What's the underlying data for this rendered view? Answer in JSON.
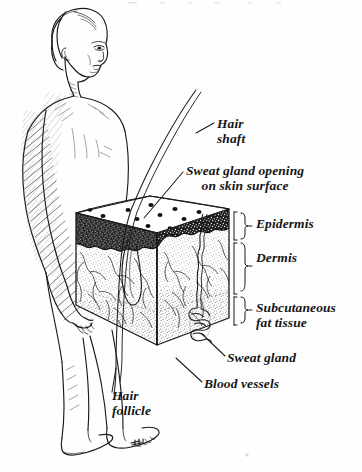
{
  "diagram": {
    "type": "anatomical-line-drawing",
    "style": "black-and-white pen-and-ink engraving",
    "background_color": "#fefefe",
    "ink_color": "#151515",
    "labels": [
      {
        "id": "hair-shaft",
        "text": "Hair\nshaft",
        "lines": [
          "Hair",
          "shaft"
        ]
      },
      {
        "id": "sweat-opening",
        "text": "Sweat gland opening\non skin surface",
        "lines": [
          "Sweat gland opening",
          "on skin surface"
        ]
      },
      {
        "id": "epidermis",
        "text": "Epidermis",
        "lines": [
          "Epidermis"
        ]
      },
      {
        "id": "dermis",
        "text": "Dermis",
        "lines": [
          "Dermis"
        ]
      },
      {
        "id": "subcutaneous",
        "text": "Subcutaneous\nfat tissue",
        "lines": [
          "Subcutaneous",
          "fat tissue"
        ]
      },
      {
        "id": "sweat-gland",
        "text": "Sweat gland",
        "lines": [
          "Sweat gland"
        ]
      },
      {
        "id": "blood-vessels",
        "text": "Blood vessels",
        "lines": [
          "Blood vessels"
        ]
      },
      {
        "id": "hair-follicle",
        "text": "Hair\nfollicle",
        "lines": [
          "Hair",
          "follicle"
        ]
      }
    ],
    "label_text": {
      "hair_shaft_line1": "Hair",
      "hair_shaft_line2": "shaft",
      "sweat_opening_line1": "Sweat gland opening",
      "sweat_opening_line2": "on skin surface",
      "epidermis": "Epidermis",
      "dermis": "Dermis",
      "subcutaneous_line1": "Subcutaneous",
      "subcutaneous_line2": "fat tissue",
      "sweat_gland": "Sweat gland",
      "blood_vessels": "Blood vessels",
      "hair_follicle_line1": "Hair",
      "hair_follicle_line2": "follicle"
    },
    "figure": {
      "name": "standing human figure",
      "description": "nude male figure seen from behind-left, head turned to the right, arms at sides, legs and feet visible at bottom"
    },
    "skin_block": {
      "name": "skin wedge block",
      "layers": [
        "Epidermis",
        "Dermis",
        "Subcutaneous fat tissue"
      ],
      "top_surface_pores": 16,
      "structures": [
        "hair shaft",
        "hair follicle",
        "sweat gland duct",
        "sweat gland coil",
        "blood vessels"
      ]
    },
    "braces": [
      {
        "target": "Epidermis",
        "y_top": 213,
        "y_bottom": 239
      },
      {
        "target": "Dermis",
        "y_top": 241,
        "y_bottom": 294
      },
      {
        "target": "Subcutaneous",
        "y_top": 297,
        "y_bottom": 325
      }
    ]
  }
}
